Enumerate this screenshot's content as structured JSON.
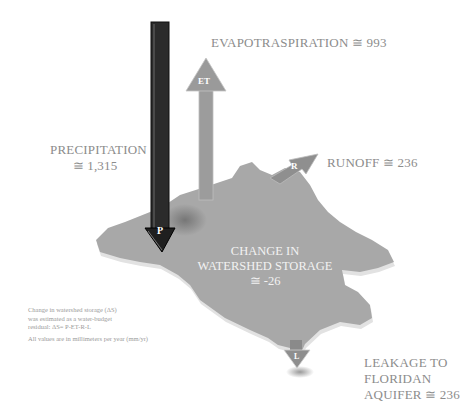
{
  "diagram": {
    "type": "water-budget",
    "labels": {
      "evapotranspiration": "EVAPOTRASPIRATION ≅ 993",
      "precipitation_line1": "PRECIPITATION",
      "precipitation_line2": "≅ 1,315",
      "runoff": "RUNOFF ≅ 236",
      "storage_line1": "CHANGE IN",
      "storage_line2": "WATERSHED STORAGE",
      "storage_line3": "≅ -26",
      "leakage_line1": "LEAKAGE TO",
      "leakage_line2": "FLORIDAN",
      "leakage_line3": "AQUIFER ≅ 236"
    },
    "arrow_letters": {
      "precipitation": "P",
      "evapotranspiration": "ET",
      "runoff": "R",
      "leakage": "L"
    },
    "notes": {
      "line1": "Change in watershed storage (ΔS)",
      "line2": "was estimated as a water-budget",
      "line3": "residual: ΔS= P-ET-R-L",
      "line4": "All values are in millimeters per year (mm/yr)"
    },
    "values_mm_per_year": {
      "precipitation": 1315,
      "evapotranspiration": 993,
      "runoff": 236,
      "leakage": 236,
      "storage_change": -26
    },
    "colors": {
      "map": "#a9a9a9",
      "map_edge": "#d8d8d8",
      "precip_arrow": "#2a2a2a",
      "et_arrow": "#9a9a9a",
      "runoff_arrow": "#909090",
      "leak_arrow": "#8e8e8e"
    }
  }
}
